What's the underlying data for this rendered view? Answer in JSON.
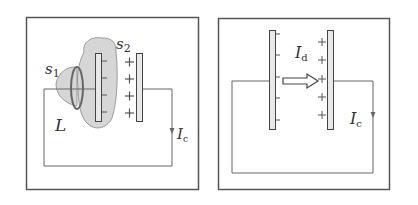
{
  "colors": {
    "frame": "#555555",
    "wire": "#666666",
    "plate_fill": "#e8e8e8",
    "plate_stroke": "#444444",
    "surface_fill": "#d6d6d6",
    "surface_stroke": "#888888",
    "loop_stroke": "#666666",
    "text": "#333333"
  },
  "panel_left": {
    "labels": {
      "s1_main": "s",
      "s1_sub": "1",
      "s2_main": "s",
      "s2_sub": "2",
      "loop": "L",
      "current_main": "I",
      "current_sub": "c"
    },
    "negative_plate_signs": [
      "-",
      "-",
      "-",
      "-"
    ],
    "positive_plate_signs": [
      "+",
      "+",
      "+",
      "+"
    ]
  },
  "panel_right": {
    "labels": {
      "displacement_main": "I",
      "displacement_sub": "d",
      "current_main": "I",
      "current_sub": "c"
    },
    "negative_plate_signs": [
      "-",
      "-",
      "-",
      "-",
      "-"
    ],
    "positive_plate_signs": [
      "+",
      "+",
      "+",
      "+",
      "+"
    ]
  }
}
